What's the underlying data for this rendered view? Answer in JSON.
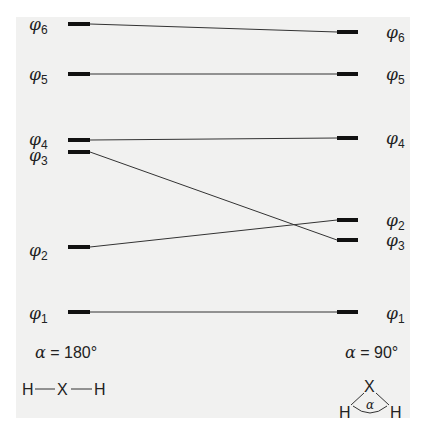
{
  "diagram": {
    "type": "walsh-correlation-diagram",
    "orbital_symbol": "φ",
    "left": {
      "angle_label": "α = 180°",
      "alpha_symbol": "α",
      "angle_text": " = 180°",
      "geometry": "linear",
      "molecule": {
        "atoms": [
          "H",
          "X",
          "H"
        ]
      },
      "levels": [
        {
          "id": "phi1",
          "label": "φ",
          "sub": "1",
          "y": 312
        },
        {
          "id": "phi2",
          "label": "φ",
          "sub": "2",
          "y": 247
        },
        {
          "id": "phi3",
          "label": "φ",
          "sub": "3",
          "y": 152
        },
        {
          "id": "phi4",
          "label": "φ",
          "sub": "4",
          "y": 140
        },
        {
          "id": "phi5",
          "label": "φ",
          "sub": "5",
          "y": 74
        },
        {
          "id": "phi6",
          "label": "φ",
          "sub": "6",
          "y": 24
        }
      ]
    },
    "right": {
      "angle_label": "α = 90°",
      "alpha_symbol": "α",
      "angle_text": " = 90°",
      "geometry": "bent",
      "molecule": {
        "atoms": [
          "H",
          "X",
          "H"
        ],
        "angle_symbol": "α"
      },
      "levels": [
        {
          "id": "phi1",
          "label": "φ",
          "sub": "1",
          "y": 312
        },
        {
          "id": "phi3",
          "label": "φ",
          "sub": "3",
          "y": 240
        },
        {
          "id": "phi2",
          "label": "φ",
          "sub": "2",
          "y": 220
        },
        {
          "id": "phi4",
          "label": "φ",
          "sub": "4",
          "y": 138
        },
        {
          "id": "phi5",
          "label": "φ",
          "sub": "5",
          "y": 74
        },
        {
          "id": "phi6",
          "label": "φ",
          "sub": "6",
          "y": 32
        }
      ]
    },
    "correlations": [
      {
        "orbital": "phi1",
        "from_y": 312,
        "to_y": 312
      },
      {
        "orbital": "phi2",
        "from_y": 247,
        "to_y": 220
      },
      {
        "orbital": "phi3",
        "from_y": 152,
        "to_y": 240
      },
      {
        "orbital": "phi4",
        "from_y": 140,
        "to_y": 138
      },
      {
        "orbital": "phi5",
        "from_y": 74,
        "to_y": 74
      },
      {
        "orbital": "phi6",
        "from_y": 24,
        "to_y": 32
      }
    ]
  }
}
